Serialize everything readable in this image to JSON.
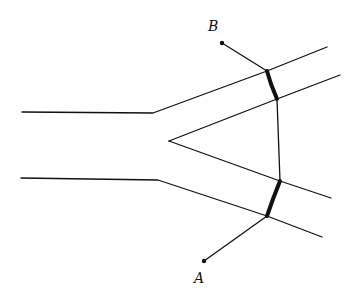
{
  "diagram": {
    "type": "ray-path-through-prism-channel",
    "points": {
      "A": {
        "label": "A",
        "dot": [
          204,
          261
        ],
        "label_pos": [
          194,
          271
        ]
      },
      "B": {
        "label": "B",
        "dot": [
          222,
          43
        ],
        "label_pos": [
          208,
          19
        ]
      }
    },
    "stroke_color": "#111111",
    "lines": [
      {
        "name": "upper-left-wall",
        "points": [
          [
            22,
            112
          ],
          [
            153,
            113
          ],
          [
            267,
            71
          ],
          [
            327,
            47
          ]
        ]
      },
      {
        "name": "lower-left-wall",
        "points": [
          [
            21,
            178
          ],
          [
            158,
            180
          ],
          [
            267,
            216
          ],
          [
            322,
            237
          ]
        ]
      },
      {
        "name": "prism-upper-edge",
        "points": [
          [
            169,
            141
          ],
          [
            277,
            99
          ],
          [
            340,
            75
          ]
        ]
      },
      {
        "name": "prism-lower-edge",
        "points": [
          [
            169,
            141
          ],
          [
            280,
            181
          ],
          [
            331,
            198
          ]
        ]
      },
      {
        "name": "prism-right-edge",
        "points": [
          [
            277,
            99
          ],
          [
            280,
            181
          ]
        ]
      },
      {
        "name": "ray-A",
        "points": [
          [
            204,
            261
          ],
          [
            267,
            216
          ]
        ]
      },
      {
        "name": "ray-B",
        "points": [
          [
            222,
            43
          ],
          [
            267,
            71
          ]
        ]
      }
    ],
    "thick_segments": [
      {
        "name": "upper-thick",
        "points": [
          [
            267,
            71
          ],
          [
            271,
            84
          ],
          [
            277,
            99
          ]
        ]
      },
      {
        "name": "lower-thick",
        "points": [
          [
            280,
            181
          ],
          [
            273,
            199
          ],
          [
            267,
            216
          ]
        ]
      }
    ]
  }
}
